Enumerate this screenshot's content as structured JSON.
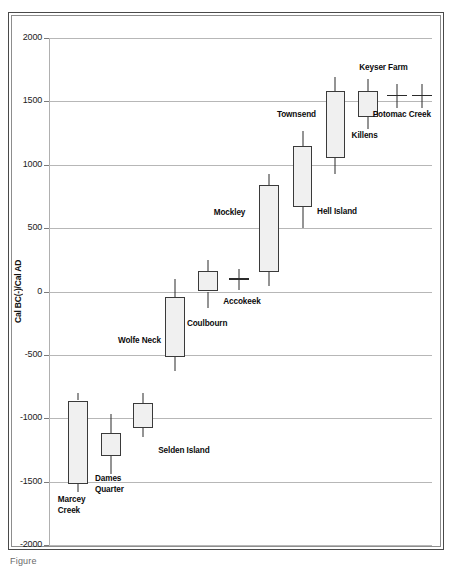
{
  "figure": {
    "caption": "Figure",
    "background_color": "#ffffff",
    "frame_color": "#4a4a4a"
  },
  "chart_data": {
    "type": "box",
    "title": "",
    "xlabel": "",
    "ylabel": "Cal BC(-)/Cal AD",
    "ylim": [
      -2000,
      2000
    ],
    "ytick_labels": [
      "2000",
      "1500",
      "1000",
      "500",
      "0",
      "-500",
      "-1000",
      "-1500",
      "-2000"
    ],
    "yticks": [
      2000,
      1500,
      1000,
      500,
      0,
      -500,
      -1000,
      -1500,
      -2000
    ],
    "grid": true,
    "legend": "none",
    "box_fill_color": "#f0f0f0",
    "box_line_color": "#3a3a3a",
    "categories": [
      "Marcey Creek",
      "Dames Quarter",
      "Selden Island",
      "Wolfe Neck",
      "Coulbourn",
      "Accokeek",
      "Mockley",
      "Hell Island",
      "Townsend",
      "Killens",
      "Keyser Farm",
      "Potomac Creek"
    ],
    "series": [
      {
        "name": "Marcey Creek",
        "label": "Marcey\nCreek",
        "label_lines": [
          "Marcey",
          "Creek"
        ],
        "whisker_high": -800,
        "box_high": -860,
        "box_low": -1520,
        "whisker_low": -1580,
        "x_center_pct": 7.6,
        "box_width_pct": 5.2,
        "label_left_pct": 2.3,
        "label_top": 495
      },
      {
        "name": "Dames Quarter",
        "label": "Dames\nQuarter",
        "label_lines": [
          "Dames",
          "Quarter"
        ],
        "whisker_high": -970,
        "box_high": -1120,
        "box_low": -1300,
        "whisker_low": -1440,
        "x_center_pct": 16.2,
        "box_width_pct": 5.2,
        "label_left_pct": 12.0,
        "label_top": 474
      },
      {
        "name": "Selden Island",
        "label": "Selden Island",
        "label_lines": [
          "Selden Island"
        ],
        "whisker_high": -800,
        "box_high": -880,
        "box_low": -1080,
        "whisker_low": -1150,
        "x_center_pct": 24.5,
        "box_width_pct": 5.2,
        "label_left_pct": 28.5,
        "label_top": 446
      },
      {
        "name": "Wolfe Neck",
        "label": "Wolfe Neck",
        "label_lines": [
          "Wolfe Neck"
        ],
        "whisker_high": 100,
        "box_high": -40,
        "box_low": -520,
        "whisker_low": -630,
        "x_center_pct": 33.0,
        "box_width_pct": 5.2,
        "label_left_pct": 18.0,
        "label_top": 336
      },
      {
        "name": "Coulbourn",
        "label": "Coulbourn",
        "label_lines": [
          "Coulbourn"
        ],
        "whisker_high": 250,
        "box_high": 160,
        "box_low": 0,
        "whisker_low": -130,
        "x_center_pct": 41.5,
        "box_width_pct": 5.2,
        "label_left_pct": 36.0,
        "label_top": 319
      },
      {
        "name": "Accokeek",
        "label": "Accokeek",
        "label_lines": [
          "Accokeek"
        ],
        "whisker_high": 180,
        "box_high": 100,
        "box_low": 100,
        "whisker_low": 10,
        "x_center_pct": 49.5,
        "box_width_pct": 5.2,
        "label_left_pct": 45.5,
        "label_top": 297
      },
      {
        "name": "Mockley",
        "label": "Mockley",
        "label_lines": [
          "Mockley"
        ],
        "whisker_high": 930,
        "box_high": 840,
        "box_low": 150,
        "whisker_low": 40,
        "x_center_pct": 57.5,
        "box_width_pct": 5.2,
        "label_left_pct": 43.0,
        "label_top": 208
      },
      {
        "name": "Hell Island",
        "label": "Hell Island",
        "label_lines": [
          "Hell Island"
        ],
        "whisker_high": 1270,
        "box_high": 1145,
        "box_low": 665,
        "whisker_low": 500,
        "x_center_pct": 66.2,
        "box_width_pct": 5.2,
        "label_left_pct": 70.0,
        "label_top": 207
      },
      {
        "name": "Townsend",
        "label": "Townsend",
        "label_lines": [
          "Townsend"
        ],
        "whisker_high": 1690,
        "box_high": 1580,
        "box_low": 1050,
        "whisker_low": 930,
        "x_center_pct": 74.8,
        "box_width_pct": 5.2,
        "label_left_pct": 59.5,
        "label_top": 110
      },
      {
        "name": "Killens",
        "label": "Killens",
        "label_lines": [
          "Killens"
        ],
        "whisker_high": 1680,
        "box_high": 1580,
        "box_low": 1380,
        "whisker_low": 1280,
        "x_center_pct": 83.2,
        "box_width_pct": 5.2,
        "label_left_pct": 79.0,
        "label_top": 131
      },
      {
        "name": "Keyser Farm",
        "label": "Keyser Farm",
        "label_lines": [
          "Keyser Farm"
        ],
        "whisker_high": 1640,
        "box_high": 1545,
        "box_low": 1545,
        "whisker_low": 1450,
        "x_center_pct": 90.8,
        "box_width_pct": 5.2,
        "label_left_pct": 81.0,
        "label_top": 63
      },
      {
        "name": "Potomac Creek",
        "label": "Potomac Creek",
        "label_lines": [
          "Potomac Creek"
        ],
        "whisker_high": 1640,
        "box_high": 1545,
        "box_low": 1545,
        "whisker_low": 1450,
        "x_center_pct": 97.5,
        "box_width_pct": 5.2,
        "label_left_pct": 84.5,
        "label_top": 110
      }
    ]
  }
}
